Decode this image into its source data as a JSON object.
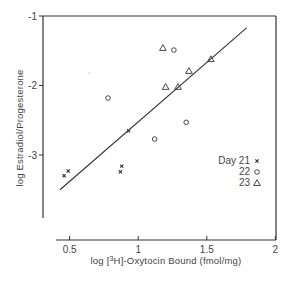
{
  "chart_data": {
    "type": "scatter",
    "title": "",
    "xlabel": "log [3H]-Oxytocin Bound (fmol/mg)",
    "ylabel": "log Estradiol/Progesterone",
    "xlim": [
      0.4,
      2.0
    ],
    "ylim": [
      -3.9,
      -1.0
    ],
    "x_ticks": [
      0.5,
      1,
      1.5,
      2
    ],
    "x_tick_labels": [
      "0.5",
      "1",
      "1.5",
      "2"
    ],
    "y_ticks": [
      -1,
      -2,
      -3
    ],
    "y_tick_labels": [
      "-1",
      "-2",
      "-3"
    ],
    "grid": false,
    "legend_position": "right-middle",
    "legend_title": "Day",
    "series": [
      {
        "name": "21",
        "label": "Day 21",
        "marker": "x",
        "points": [
          [
            0.46,
            -3.3
          ],
          [
            0.49,
            -3.23
          ],
          [
            0.93,
            -2.65
          ],
          [
            0.88,
            -3.16
          ],
          [
            0.87,
            -3.24
          ]
        ]
      },
      {
        "name": "22",
        "label": "22",
        "marker": "circle",
        "points": [
          [
            0.78,
            -2.18
          ],
          [
            1.26,
            -1.49
          ],
          [
            1.12,
            -2.77
          ],
          [
            1.35,
            -2.53
          ]
        ]
      },
      {
        "name": "23",
        "label": "23",
        "marker": "triangle",
        "points": [
          [
            1.18,
            -1.46
          ],
          [
            1.2,
            -2.02
          ],
          [
            1.37,
            -1.79
          ],
          [
            1.29,
            -2.02
          ],
          [
            1.53,
            -1.62
          ]
        ]
      }
    ],
    "regression_line": {
      "x": [
        0.43,
        1.79
      ],
      "y": [
        -3.5,
        -1.17
      ]
    }
  },
  "labels": {
    "y_axis_title": "log Estradiol/Progesterone",
    "x_axis_title_prefix": "log [",
    "x_axis_title_sup": "3",
    "x_axis_title_suffix": "H]-Oxytocin Bound (fmol/mg)",
    "legend_rows": [
      {
        "text": "Day 21",
        "symbol": "x"
      },
      {
        "text": "22",
        "symbol": "o"
      },
      {
        "text": "23",
        "symbol": "△"
      }
    ]
  },
  "colors": {
    "ink": "#333333",
    "background": "#ffffff"
  }
}
